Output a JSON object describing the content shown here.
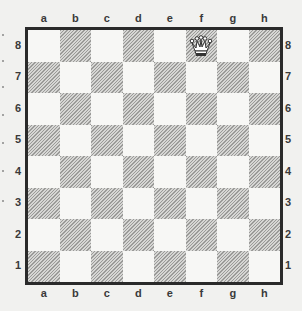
{
  "board": {
    "files": [
      "a",
      "b",
      "c",
      "d",
      "e",
      "f",
      "g",
      "h"
    ],
    "ranks": [
      "8",
      "7",
      "6",
      "5",
      "4",
      "3",
      "2",
      "1"
    ],
    "orientation": "white-bottom",
    "colors": {
      "light": "#f7f7f5",
      "dark": "#b4b4b2",
      "border": "#2a2a2a"
    }
  },
  "pieces": [
    {
      "square": "f8",
      "piece": "queen",
      "color": "white",
      "icon": "white-queen-icon"
    }
  ]
}
